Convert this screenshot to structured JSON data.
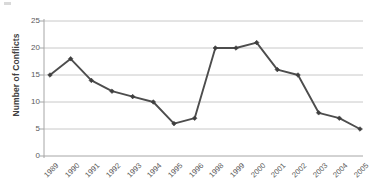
{
  "chart_data": {
    "type": "line",
    "title": "",
    "subtitle": "",
    "xlabel": "",
    "ylabel": "Number of Conflicts",
    "categories": [
      "1989",
      "1990",
      "1991",
      "1992",
      "1993",
      "1994",
      "1995",
      "1996",
      "1998",
      "1999",
      "2000",
      "2001",
      "2002",
      "2003",
      "2004",
      "2005"
    ],
    "values": [
      15,
      18,
      14,
      12,
      11,
      10,
      6,
      7,
      20,
      20,
      21,
      16,
      15,
      8,
      7,
      5
    ],
    "series": [
      {
        "name": "Number of Conflicts",
        "values": [
          15,
          18,
          14,
          12,
          11,
          10,
          6,
          7,
          20,
          20,
          21,
          16,
          15,
          8,
          7,
          5
        ]
      }
    ],
    "ylim": [
      0,
      25
    ],
    "yticks": [
      0,
      5,
      10,
      15,
      20,
      25
    ],
    "ytick_labels": [
      "0",
      "5",
      "10",
      "15",
      "20",
      "25"
    ],
    "grid": "horizontal",
    "legend": "none",
    "annotations": [],
    "colors": {
      "line": "#4d4d4d",
      "marker": "#3f3f3f",
      "gridline": "#c8c8c8",
      "axis": "#9a9a9a",
      "tick_text": "#595959",
      "axis_title": "#404040",
      "background": "#ffffff"
    }
  }
}
